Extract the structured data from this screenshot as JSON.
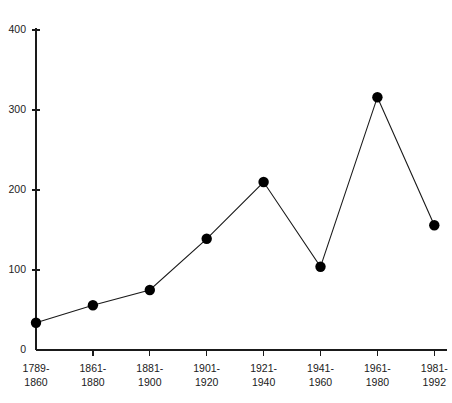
{
  "chart_data": {
    "type": "line",
    "title": "",
    "subtitle": "",
    "xlabel": "",
    "ylabel": "",
    "categories": [
      "1789-\n1860",
      "1861-\n1880",
      "1881-\n1900",
      "1901-\n1920",
      "1921-\n1940",
      "1941-\n1960",
      "1961-\n1980",
      "1981-\n1992"
    ],
    "category_lines": [
      [
        "1789-",
        "1860"
      ],
      [
        "1861-",
        "1880"
      ],
      [
        "1881-",
        "1900"
      ],
      [
        "1901-",
        "1920"
      ],
      [
        "1921-",
        "1940"
      ],
      [
        "1941-",
        "1960"
      ],
      [
        "1961-",
        "1980"
      ],
      [
        "1981-",
        "1992"
      ]
    ],
    "values": [
      34,
      56,
      75,
      139,
      210,
      104,
      316,
      156
    ],
    "ylim": [
      0,
      400
    ],
    "yticks": [
      0,
      100,
      200,
      300,
      400
    ],
    "ytick_labels": [
      "0",
      "100",
      "200",
      "300",
      "400"
    ],
    "grid": false,
    "legend": null,
    "marker": "filled-circle",
    "marker_color": "#000000",
    "line_color": "#1a1a1a",
    "background_color": "#ffffff"
  }
}
